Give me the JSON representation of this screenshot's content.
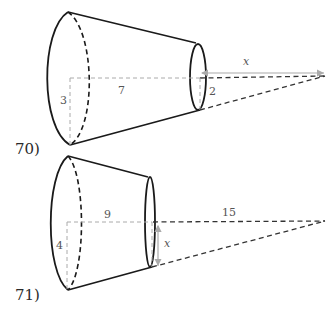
{
  "problems": [
    {
      "number": "70)",
      "labels": {
        "large_radius": "3",
        "frustum_length": "7",
        "small_radius": "2",
        "unknown": "x"
      }
    },
    {
      "number": "71)",
      "labels": {
        "large_radius": "4",
        "frustum_length": "9",
        "cone_extension": "15",
        "unknown": "x"
      }
    }
  ],
  "colors": {
    "outline": "#1a1a1a",
    "guide": "#aaaaaa",
    "label": "#555555"
  }
}
